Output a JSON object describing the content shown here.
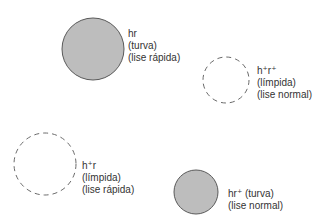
{
  "colors": {
    "filled_fill": "#bdbdbd",
    "filled_stroke": "#5a5a5a",
    "dashed_stroke": "#6a6a6a",
    "text": "#333333"
  },
  "circles": [
    {
      "id": "hr",
      "style": "filled",
      "cx": 93,
      "cy": 49,
      "r": 31,
      "lines": [
        "hr",
        "(turva)",
        "(lise rápida)"
      ]
    },
    {
      "id": "h+r+",
      "style": "dashed",
      "cx": 226,
      "cy": 80,
      "r": 23,
      "lines": [
        "h⁺r⁺",
        "(límpida)",
        "(lise normal)"
      ]
    },
    {
      "id": "h+r",
      "style": "dashed",
      "cx": 45,
      "cy": 164,
      "r": 31,
      "lines": [
        "h⁺r",
        "(límpida)",
        "(lise rápida)"
      ]
    },
    {
      "id": "hr+",
      "style": "filled",
      "cx": 196,
      "cy": 192,
      "r": 22,
      "lines": [
        "hr⁺ (turva)",
        "(lise normal)"
      ]
    }
  ]
}
